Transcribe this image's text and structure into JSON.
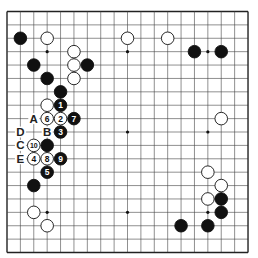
{
  "board": {
    "size": 19,
    "origin": [
      7,
      11.5
    ],
    "spacing": 13.39,
    "line_color": "#444444",
    "edge_color": "#222222",
    "black_color": "#111111",
    "white_color": "#ffffff",
    "hoshi": [
      [
        3,
        3
      ],
      [
        9,
        3
      ],
      [
        15,
        3
      ],
      [
        3,
        9
      ],
      [
        9,
        9
      ],
      [
        15,
        9
      ],
      [
        3,
        15
      ],
      [
        9,
        15
      ],
      [
        15,
        15
      ]
    ],
    "stones": [
      {
        "color": "black",
        "col": 1,
        "row": 2
      },
      {
        "color": "white",
        "col": 3,
        "row": 2
      },
      {
        "color": "white",
        "col": 9,
        "row": 2
      },
      {
        "color": "white",
        "col": 12,
        "row": 2
      },
      {
        "color": "black",
        "col": 14,
        "row": 3
      },
      {
        "color": "black",
        "col": 16,
        "row": 3
      },
      {
        "color": "white",
        "col": 5,
        "row": 3
      },
      {
        "color": "black",
        "col": 2,
        "row": 4
      },
      {
        "color": "white",
        "col": 5,
        "row": 4
      },
      {
        "color": "black",
        "col": 6,
        "row": 4
      },
      {
        "color": "black",
        "col": 3,
        "row": 5
      },
      {
        "color": "white",
        "col": 5,
        "row": 5
      },
      {
        "color": "black",
        "col": 4,
        "row": 6
      },
      {
        "color": "white",
        "col": 3,
        "row": 7
      },
      {
        "color": "black",
        "col": 4,
        "row": 7,
        "label": "1"
      },
      {
        "color": "white",
        "col": 4,
        "row": 8,
        "label": "2"
      },
      {
        "color": "black",
        "col": 4,
        "row": 9,
        "label": "3"
      },
      {
        "color": "white",
        "col": 2,
        "row": 11,
        "label": "4"
      },
      {
        "color": "black",
        "col": 3,
        "row": 12,
        "label": "5"
      },
      {
        "color": "white",
        "col": 3,
        "row": 8,
        "label": "6"
      },
      {
        "color": "black",
        "col": 5,
        "row": 8,
        "label": "7"
      },
      {
        "color": "white",
        "col": 3,
        "row": 11,
        "label": "8"
      },
      {
        "color": "black",
        "col": 4,
        "row": 11,
        "label": "9"
      },
      {
        "color": "white",
        "col": 2,
        "row": 10,
        "label": "10"
      },
      {
        "color": "black",
        "col": 3,
        "row": 10
      },
      {
        "color": "black",
        "col": 2,
        "row": 13
      },
      {
        "color": "white",
        "col": 2,
        "row": 15
      },
      {
        "color": "white",
        "col": 3,
        "row": 16
      },
      {
        "color": "white",
        "col": 16,
        "row": 8
      },
      {
        "color": "white",
        "col": 15,
        "row": 12
      },
      {
        "color": "white",
        "col": 16,
        "row": 13
      },
      {
        "color": "white",
        "col": 15,
        "row": 14
      },
      {
        "color": "black",
        "col": 16,
        "row": 14
      },
      {
        "color": "black",
        "col": 16,
        "row": 15
      },
      {
        "color": "black",
        "col": 13,
        "row": 16
      },
      {
        "color": "black",
        "col": 15,
        "row": 16
      }
    ],
    "markers": [
      {
        "text": "A",
        "col": 2,
        "row": 8
      },
      {
        "text": "B",
        "col": 3,
        "row": 9
      },
      {
        "text": "C",
        "col": 1,
        "row": 10
      },
      {
        "text": "D",
        "col": 1,
        "row": 9
      },
      {
        "text": "E",
        "col": 1,
        "row": 11
      }
    ]
  }
}
